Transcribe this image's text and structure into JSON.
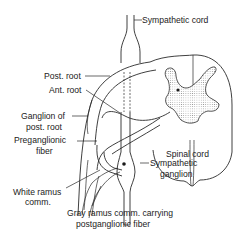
{
  "diagram": {
    "type": "anatomical-line-drawing",
    "colors": {
      "ink": "#2a2a2a",
      "background": "#ffffff",
      "gray_matter_stipple": "#9a9a9a"
    },
    "labels": {
      "sympathetic_cord": "Sympathetic cord",
      "post_root": "Post. root",
      "ant_root": "Ant. root",
      "ganglion_line1": "Ganglion of",
      "ganglion_line2": "post. root",
      "preganglionic_line1": "Preganglionic",
      "preganglionic_line2": "fiber",
      "spinal_cord": "Spinal cord",
      "sympathetic_ganglion_line1": "Sympathetic",
      "sympathetic_ganglion_line2": "ganglion",
      "white_ramus_line1": "White ramus",
      "white_ramus_line2": "comm.",
      "gray_ramus_line1": "Gray ramus comm. carrying",
      "gray_ramus_line2": "postganglionic fiber"
    }
  }
}
